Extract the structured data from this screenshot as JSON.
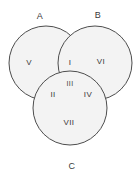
{
  "diagram": {
    "background_color": "#ffffff",
    "circle_fill_color": "#f3f3f3",
    "circle_stroke_color": "#4d4d4d",
    "label_color": "#3a3a3a",
    "sets": [
      {
        "id": "A",
        "label": "A",
        "cx": 46,
        "cy": 63,
        "r": 37,
        "label_x": 40,
        "label_y": 17
      },
      {
        "id": "B",
        "label": "B",
        "cx": 95,
        "cy": 63,
        "r": 37,
        "label_x": 98,
        "label_y": 16
      },
      {
        "id": "C",
        "label": "C",
        "cx": 70,
        "cy": 108,
        "r": 37,
        "label_x": 72,
        "label_y": 167
      }
    ],
    "regions": [
      {
        "id": "I",
        "label": "I",
        "meaning": "A and B only",
        "x": 70,
        "y": 63
      },
      {
        "id": "II",
        "label": "II",
        "meaning": "A and C only",
        "x": 53,
        "y": 95
      },
      {
        "id": "III",
        "label": "III",
        "meaning": "A and B and C",
        "x": 70,
        "y": 84
      },
      {
        "id": "IV",
        "label": "IV",
        "meaning": "B and C only",
        "x": 88,
        "y": 95
      },
      {
        "id": "V",
        "label": "V",
        "meaning": "A only",
        "x": 29,
        "y": 63
      },
      {
        "id": "VI",
        "label": "VI",
        "meaning": "B only",
        "x": 101,
        "y": 62
      },
      {
        "id": "VII",
        "label": "VII",
        "meaning": "C only",
        "x": 69,
        "y": 123
      }
    ]
  }
}
